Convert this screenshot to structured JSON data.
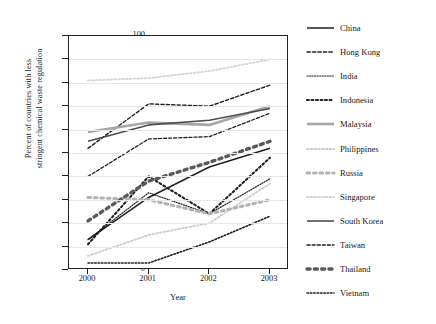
{
  "chart_data": {
    "type": "line",
    "title": "",
    "xlabel": "Year",
    "ylabel": "Percent of countries with less stringent chemical waste regulation",
    "ylabel_line1": "Percent of countries with less",
    "ylabel_line2": "stringent chemical waste regulation",
    "x": [
      2000,
      2001,
      2002,
      2003
    ],
    "xticklabels": [
      "2000",
      "2001",
      "2002",
      "2003"
    ],
    "yticklabels": [
      "0",
      "10",
      "20",
      "30",
      "40",
      "50",
      "60",
      "70",
      "80",
      "90",
      "100"
    ],
    "yticks": [
      0,
      10,
      20,
      30,
      40,
      50,
      60,
      70,
      80,
      90,
      100
    ],
    "ylim": [
      0,
      100
    ],
    "xlim": [
      2000,
      2003
    ],
    "grid": "horizontal",
    "legend_position": "right",
    "series": [
      {
        "name": "China",
        "values": [
          13,
          31,
          44,
          52
        ],
        "color": "#231f20",
        "style": "solid",
        "width": 1.5
      },
      {
        "name": "Hong Kong",
        "values": [
          52,
          71,
          70,
          79
        ],
        "color": "#231f20",
        "style": "dashed",
        "width": 1.4
      },
      {
        "name": "India",
        "values": [
          13,
          33,
          24,
          39
        ],
        "color": "#231f20",
        "style": "dotted-fine",
        "width": 1.2
      },
      {
        "name": "Indonesia",
        "values": [
          11,
          40,
          24,
          48
        ],
        "color": "#231f20",
        "style": "dotted-bold",
        "width": 2.1
      },
      {
        "name": "Malaysia",
        "values": [
          59,
          63,
          62,
          70
        ],
        "color": "#a6a6a6",
        "style": "solid",
        "width": 2.6
      },
      {
        "name": "Philippines",
        "values": [
          6,
          15,
          20,
          37
        ],
        "color": "#cccccc",
        "style": "dotted-fine",
        "width": 1.8
      },
      {
        "name": "Russia",
        "values": [
          31,
          30,
          24,
          30
        ],
        "color": "#b3b3b3",
        "style": "dotted-bold",
        "width": 3.0
      },
      {
        "name": "Singapore",
        "values": [
          81,
          82,
          85,
          90
        ],
        "color": "#d4d4d4",
        "style": "dotted-fine",
        "width": 1.8
      },
      {
        "name": "South Korea",
        "values": [
          55,
          62,
          64,
          69
        ],
        "color": "#4d4d4d",
        "style": "solid",
        "width": 1.6
      },
      {
        "name": "Taiwan",
        "values": [
          40,
          56,
          57,
          67
        ],
        "color": "#231f20",
        "style": "dashed",
        "width": 1.3
      },
      {
        "name": "Thailand",
        "values": [
          21,
          38,
          46,
          55
        ],
        "color": "#595959",
        "style": "dotted-bold",
        "width": 3.4
      },
      {
        "name": "Vietnam",
        "values": [
          3,
          3,
          12,
          23
        ],
        "color": "#231f20",
        "style": "dotted-fine",
        "width": 1.6
      }
    ]
  }
}
